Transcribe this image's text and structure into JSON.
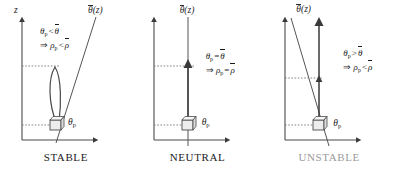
{
  "figure": {
    "title_semantic": "atmospheric-stability-parcel-diagrams",
    "background": "#ffffff",
    "ink": "#1b1b1b",
    "dim_ink": "#9a9a9a"
  },
  "panels": [
    {
      "id": "stable",
      "caption": "STABLE",
      "caption_dimmed": false,
      "axis_y_label": "z",
      "profile_label": {
        "bar_symbol": "θ",
        "arg": "(z)"
      },
      "parcel_label": {
        "symbol": "θ",
        "sub": "p"
      },
      "relation": {
        "line1": {
          "lhs_symbol": "θ",
          "lhs_sub": "p",
          "operator": "<",
          "rhs_symbol": "θ",
          "rhs_bar": true
        },
        "line2": {
          "implies": "⇒",
          "lhs_symbol": "ρ",
          "lhs_sub": "p",
          "operator": "<",
          "rhs_symbol": "ρ",
          "rhs_bar": true
        }
      },
      "profile_slope": "positive",
      "motion": "oscillating-return",
      "arrow_note": "loop up then back down to parcel"
    },
    {
      "id": "neutral",
      "caption": "NEUTRAL",
      "caption_dimmed": false,
      "axis_y_label": "",
      "profile_label": {
        "bar_symbol": "θ",
        "arg": "(z)"
      },
      "parcel_label": {
        "symbol": "θ",
        "sub": "p"
      },
      "relation": {
        "line1": {
          "lhs_symbol": "θ",
          "lhs_sub": "p",
          "operator": "=",
          "rhs_symbol": "θ",
          "rhs_bar": true
        },
        "line2": {
          "implies": "⇒",
          "lhs_symbol": "ρ",
          "lhs_sub": "p",
          "operator": "=",
          "rhs_symbol": "ρ",
          "rhs_bar": true
        }
      },
      "profile_slope": "vertical",
      "motion": "straight-up-stays",
      "arrow_note": "single straight arrow up to displaced level"
    },
    {
      "id": "unstable",
      "caption": "UNSTABLE",
      "caption_dimmed": true,
      "axis_y_label": "",
      "profile_label": {
        "bar_symbol": "θ",
        "arg": "(z)"
      },
      "parcel_label": {
        "symbol": "θ",
        "sub": "p"
      },
      "relation": {
        "line1": {
          "lhs_symbol": "θ",
          "lhs_sub": "p",
          "operator": ">",
          "rhs_symbol": "θ",
          "rhs_bar": true
        },
        "line2": {
          "implies": "⇒",
          "lhs_symbol": "ρ",
          "lhs_sub": "p",
          "operator": "<",
          "rhs_symbol": "ρ",
          "rhs_bar": true
        }
      },
      "profile_slope": "negative",
      "motion": "accelerating-up",
      "arrow_note": "long arrow up with intermediate arrowhead"
    }
  ]
}
